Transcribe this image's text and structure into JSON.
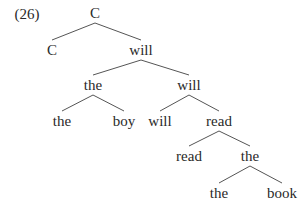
{
  "example_number": "(26)",
  "tree": {
    "nodes": [
      {
        "id": "n0",
        "label": "C",
        "x": 95,
        "y": 13
      },
      {
        "id": "n1",
        "label": "C",
        "x": 52,
        "y": 50
      },
      {
        "id": "n2",
        "label": "will",
        "x": 141,
        "y": 50
      },
      {
        "id": "n3",
        "label": "the",
        "x": 93,
        "y": 85
      },
      {
        "id": "n4",
        "label": "will",
        "x": 189,
        "y": 85
      },
      {
        "id": "n5",
        "label": "the",
        "x": 62,
        "y": 121
      },
      {
        "id": "n6",
        "label": "boy",
        "x": 124,
        "y": 121
      },
      {
        "id": "n7",
        "label": "will",
        "x": 160,
        "y": 121
      },
      {
        "id": "n8",
        "label": "read",
        "x": 219,
        "y": 121
      },
      {
        "id": "n9",
        "label": "read",
        "x": 189,
        "y": 156
      },
      {
        "id": "n10",
        "label": "the",
        "x": 250,
        "y": 156
      },
      {
        "id": "n11",
        "label": "the",
        "x": 219,
        "y": 193
      },
      {
        "id": "n12",
        "label": "book",
        "x": 282,
        "y": 193
      }
    ],
    "edges": [
      [
        "n0",
        "n1"
      ],
      [
        "n0",
        "n2"
      ],
      [
        "n2",
        "n3"
      ],
      [
        "n2",
        "n4"
      ],
      [
        "n3",
        "n5"
      ],
      [
        "n3",
        "n6"
      ],
      [
        "n4",
        "n7"
      ],
      [
        "n4",
        "n8"
      ],
      [
        "n8",
        "n9"
      ],
      [
        "n8",
        "n10"
      ],
      [
        "n10",
        "n11"
      ],
      [
        "n10",
        "n12"
      ]
    ]
  }
}
